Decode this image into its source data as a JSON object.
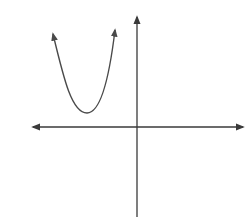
{
  "diagram": {
    "type": "function-graph",
    "colors": {
      "background": "#ffffff",
      "axes": "#3a3a3a",
      "curve": "#4a4a4a"
    },
    "axes": {
      "origin_px": [
        137,
        127
      ],
      "x_axis": {
        "left_tip_px": [
          31,
          127
        ],
        "right_tip_px": [
          245,
          127
        ],
        "arrows": "both"
      },
      "y_axis": {
        "top_tip_px": [
          137,
          15
        ],
        "bottom_px": [
          137,
          217
        ],
        "arrows": "top"
      }
    },
    "curve": {
      "shape": "parabola",
      "opens": "up",
      "vertex_px": [
        87,
        113
      ],
      "left_end_px": [
        52,
        32
      ],
      "right_end_px": [
        116,
        28
      ],
      "end_arrows": true
    }
  }
}
